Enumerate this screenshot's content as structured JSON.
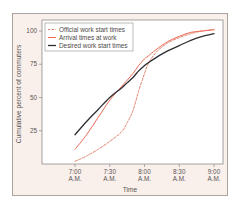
{
  "chart_data": {
    "type": "line",
    "title": "",
    "xlabel": "Time",
    "ylabel": "Cumulative percent of commuters",
    "x_ticks": [
      {
        "line1": "7:00",
        "line2": "A.M.",
        "minutes": 0
      },
      {
        "line1": "7:30",
        "line2": "A.M.",
        "minutes": 30
      },
      {
        "line1": "8:00",
        "line2": "A.M.",
        "minutes": 60
      },
      {
        "line1": "8:30",
        "line2": "A.M.",
        "minutes": 90
      },
      {
        "line1": "9:00",
        "line2": "A.M.",
        "minutes": 120
      }
    ],
    "y_ticks": [
      25,
      50,
      75,
      100
    ],
    "xlim_minutes": [
      -20,
      122
    ],
    "ylim": [
      0,
      105
    ],
    "grid": false,
    "legend_position": "upper-left",
    "x_minutes": [
      0,
      10,
      20,
      30,
      40,
      45,
      50,
      55,
      60,
      63,
      70,
      80,
      90,
      100,
      110,
      120
    ],
    "series": [
      {
        "name": "Official work start times",
        "color": "#e0826e",
        "style": "dashed",
        "values": [
          2,
          6,
          11,
          17,
          24,
          31,
          40,
          55,
          68,
          75,
          84,
          91,
          95,
          98,
          100,
          101
        ]
      },
      {
        "name": "Arrival times at work",
        "color": "#ee6a55",
        "style": "solid",
        "values": [
          11,
          22,
          35,
          48,
          58,
          63,
          68,
          74,
          79,
          81,
          86,
          92,
          96,
          99,
          100,
          101
        ]
      },
      {
        "name": "Desired work start times",
        "color": "#2e2d33",
        "style": "solid",
        "values": [
          22,
          32,
          41,
          50,
          57,
          61,
          65,
          70,
          74,
          76,
          80,
          85,
          89,
          93,
          96,
          98
        ]
      }
    ]
  }
}
